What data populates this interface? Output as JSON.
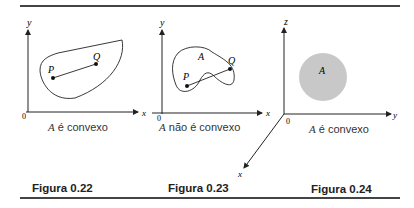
{
  "figures": [
    {
      "id": "fig-0-22",
      "label": "Figura 0.22",
      "caption_var": "A",
      "caption_text": " é convexo",
      "axes": {
        "x": "x",
        "y": "y",
        "origin": "0"
      },
      "points": [
        "P",
        "Q"
      ],
      "region": "convex blob"
    },
    {
      "id": "fig-0-23",
      "label": "Figura 0.23",
      "caption_var": "A",
      "caption_text": " não é convexo",
      "axes": {
        "x": "x",
        "y": "y",
        "origin": "0"
      },
      "points": [
        "P",
        "Q"
      ],
      "region_label": "A",
      "region": "non-convex kidney shape"
    },
    {
      "id": "fig-0-24",
      "label": "Figura 0.24",
      "caption_var": "A",
      "caption_text": " é convexo",
      "axes": {
        "x": "x",
        "y": "y",
        "z": "z",
        "origin": "0"
      },
      "region_label": "A",
      "region": "filled gray disk",
      "region_color": "#c8c8c8"
    }
  ],
  "extra_axis_labels": {
    "left_x_fig23": "x"
  }
}
